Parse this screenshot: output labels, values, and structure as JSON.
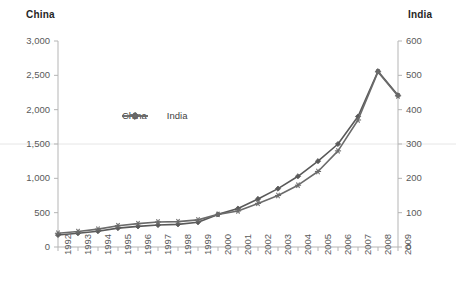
{
  "chart_data": {
    "type": "line",
    "title": "",
    "xlabel": "",
    "categories": [
      "1992",
      "1993",
      "1994",
      "1995",
      "1996",
      "1997",
      "1998",
      "1999",
      "2000",
      "2001",
      "2002",
      "2003",
      "2004",
      "2005",
      "2006",
      "2007",
      "2008",
      "2009"
    ],
    "grid": true,
    "legend_position": "inside-top-left",
    "axes": {
      "left": {
        "title": "China",
        "ylim": [
          0,
          3000
        ],
        "ticks": [
          "0",
          "500",
          "1,000",
          "1,500",
          "2,000",
          "2,500",
          "3,000"
        ],
        "tick_values": [
          0,
          500,
          1000,
          1500,
          2000,
          2500,
          3000
        ]
      },
      "right": {
        "title": "India",
        "ylim": [
          0,
          600
        ],
        "ticks": [
          "0",
          "100",
          "200",
          "300",
          "400",
          "500",
          "600"
        ],
        "tick_values": [
          0,
          100,
          200,
          300,
          400,
          500,
          600
        ]
      }
    },
    "series": [
      {
        "name": "China",
        "axis": "left",
        "marker": "diamond",
        "color": "#595959",
        "values": [
          175,
          200,
          230,
          275,
          300,
          320,
          330,
          360,
          475,
          560,
          700,
          850,
          1030,
          1250,
          1500,
          1900,
          2560,
          2210
        ]
      },
      {
        "name": "India",
        "axis": "right",
        "marker": "asterisk",
        "color": "#6b6b6b",
        "values": [
          40,
          45,
          52,
          62,
          68,
          73,
          74,
          79,
          95,
          105,
          127,
          150,
          180,
          220,
          280,
          370,
          510,
          440
        ]
      }
    ]
  },
  "legend": {
    "items": [
      {
        "label": "China",
        "marker": "diamond"
      },
      {
        "label": "India",
        "marker": "asterisk"
      }
    ]
  },
  "colors": {
    "series_china": "#595959",
    "series_india": "#6b6b6b",
    "axis_line": "#b5b5b5",
    "grid_line": "#e6e6e6",
    "tick_text": "#5a5a5a",
    "title_text": "#262626"
  }
}
